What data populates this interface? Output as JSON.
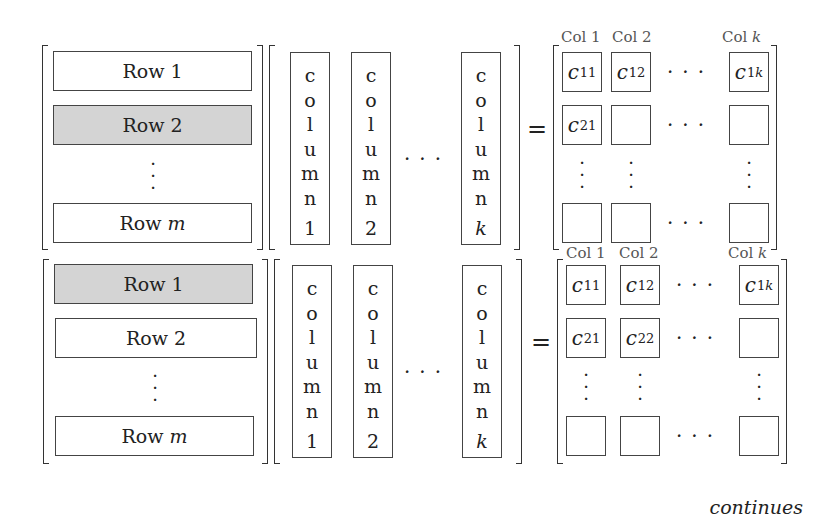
{
  "panels": [
    {
      "rows": [
        {
          "label": "Row",
          "index": "1",
          "highlighted": false
        },
        {
          "label": "Row",
          "index": "2",
          "highlighted": true
        },
        {
          "label": "Row",
          "index": "m",
          "highlighted": false
        }
      ],
      "columns": [
        {
          "letters": [
            "c",
            "o",
            "l",
            "u",
            "m",
            "n"
          ],
          "index": "1",
          "highlighted": true
        },
        {
          "letters": [
            "c",
            "o",
            "l",
            "u",
            "m",
            "n"
          ],
          "index": "2",
          "highlighted": false
        },
        {
          "letters": [
            "c",
            "o",
            "l",
            "u",
            "m",
            "n"
          ],
          "index": "k",
          "highlighted": false
        }
      ],
      "col_headers": [
        "Col 1",
        "Col 2",
        "Col k"
      ],
      "result_cells": [
        {
          "row": 1,
          "col": 1,
          "label": "c",
          "sub": "11",
          "highlighted": false
        },
        {
          "row": 1,
          "col": 2,
          "label": "c",
          "sub": "12",
          "highlighted": false
        },
        {
          "row": 1,
          "col": "k",
          "label": "c",
          "sub": "1k",
          "highlighted": false
        },
        {
          "row": 2,
          "col": 1,
          "label": "c",
          "sub": "21",
          "highlighted": true
        },
        {
          "row": 2,
          "col": 2,
          "label": "",
          "sub": "",
          "highlighted": false
        },
        {
          "row": 2,
          "col": "k",
          "label": "",
          "sub": "",
          "highlighted": false
        }
      ]
    },
    {
      "rows": [
        {
          "label": "Row",
          "index": "1",
          "highlighted": true
        },
        {
          "label": "Row",
          "index": "2",
          "highlighted": false
        },
        {
          "label": "Row",
          "index": "m",
          "highlighted": false
        }
      ],
      "columns": [
        {
          "letters": [
            "c",
            "o",
            "l",
            "u",
            "m",
            "n"
          ],
          "index": "1",
          "highlighted": false
        },
        {
          "letters": [
            "c",
            "o",
            "l",
            "u",
            "m",
            "n"
          ],
          "index": "2",
          "highlighted": true
        },
        {
          "letters": [
            "c",
            "o",
            "l",
            "u",
            "m",
            "n"
          ],
          "index": "k",
          "highlighted": false
        }
      ],
      "col_headers": [
        "Col 1",
        "Col 2",
        "Col k"
      ],
      "result_cells": [
        {
          "row": 1,
          "col": 1,
          "label": "c",
          "sub": "11",
          "highlighted": false
        },
        {
          "row": 1,
          "col": 2,
          "label": "c",
          "sub": "12",
          "highlighted": false
        },
        {
          "row": 1,
          "col": "k",
          "label": "c",
          "sub": "1k",
          "highlighted": false
        },
        {
          "row": 2,
          "col": 1,
          "label": "c",
          "sub": "21",
          "highlighted": false
        },
        {
          "row": 2,
          "col": 2,
          "label": "c",
          "sub": "22",
          "highlighted": true
        },
        {
          "row": 2,
          "col": "k",
          "label": "",
          "sub": "",
          "highlighted": false
        }
      ]
    }
  ],
  "symbols": {
    "equals": "=",
    "hdots": "...",
    "vdots": "⋮"
  },
  "colors": {
    "highlight": "#d4d4d4",
    "border": "#444444",
    "header_text": "#555555"
  },
  "footer": {
    "continues": "continues"
  }
}
